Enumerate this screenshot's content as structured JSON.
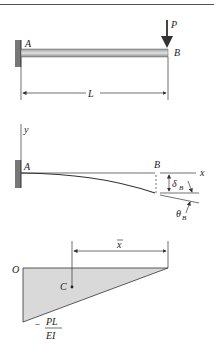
{
  "figure": {
    "panel_a": {
      "support_label": "A",
      "load_label": "P",
      "free_end_label": "B",
      "length_label": "L"
    },
    "panel_b": {
      "y_axis_label": "y",
      "x_axis_label": "x",
      "support_label": "A",
      "free_end_label": "B",
      "deflection_label": "δ",
      "deflection_sub": "B",
      "rotation_label": "θ",
      "rotation_sub": "B"
    },
    "panel_c": {
      "origin_label": "O",
      "centroid_label": "C",
      "xbar_label": "x",
      "moment_sign": "−",
      "moment_num": "PL",
      "moment_den": "EI"
    }
  },
  "colors": {
    "line": "#333333",
    "wall": "#777777",
    "beam_fill": "#bdbdbd",
    "diagram_fill": "#d9d9d9"
  }
}
